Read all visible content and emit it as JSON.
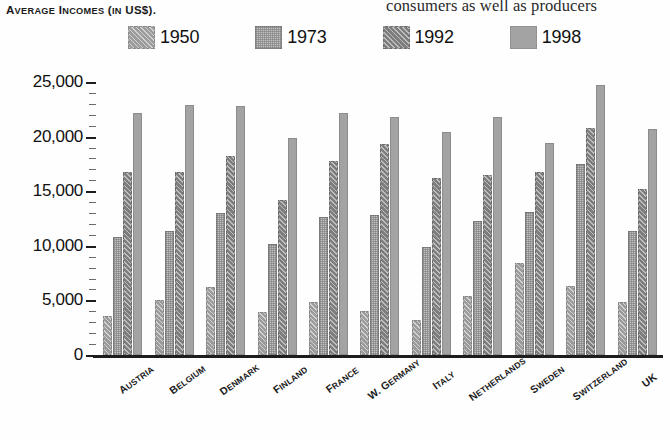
{
  "bleed": {
    "text": "consumers as well as producers"
  },
  "chart_data": {
    "type": "bar",
    "title": "Average Incomes (in US$).",
    "title_parts": {
      "lead1": "A",
      "rest1": "VERAGE",
      "lead2": "I",
      "rest2": "NCOMES",
      "mid": "(",
      "lead3": "IN",
      "rest3": " US$)."
    },
    "xlabel": "",
    "ylabel": "",
    "ylim": [
      0,
      25000
    ],
    "ytick_step": 5000,
    "yminor_step": 1000,
    "grid": false,
    "legend_position": "top",
    "categories": [
      "Austria",
      "Belgium",
      "Denmark",
      "Finland",
      "France",
      "W. Germany",
      "Italy",
      "Netherlands",
      "Sweden",
      "Switzerland",
      "UK"
    ],
    "ytick_labels": [
      "0",
      "5,000",
      "10,000",
      "15,000",
      "20,000",
      "25,000"
    ],
    "series": [
      {
        "name": "1950",
        "color": "#9b9b9b",
        "pattern": "diagonal-hatch",
        "values": [
          3600,
          5000,
          6200,
          3900,
          4900,
          4000,
          3200,
          5400,
          8400,
          6300,
          4900
        ]
      },
      {
        "name": "1973",
        "color": "#c2c2c2",
        "pattern": "fine-grid",
        "values": [
          10800,
          11400,
          13000,
          10200,
          12600,
          12800,
          9900,
          12300,
          13100,
          17500,
          11400
        ]
      },
      {
        "name": "1992",
        "color": "#7d7d7d",
        "pattern": "diagonal-hatch-dark",
        "values": [
          16800,
          16800,
          18200,
          14200,
          17800,
          19300,
          16200,
          16500,
          16800,
          20800,
          15200
        ]
      },
      {
        "name": "1998",
        "color": "#a3a3a3",
        "pattern": "solid",
        "values": [
          22200,
          22900,
          22800,
          19900,
          22200,
          21800,
          20400,
          21800,
          19400,
          24700,
          20700
        ]
      }
    ]
  }
}
